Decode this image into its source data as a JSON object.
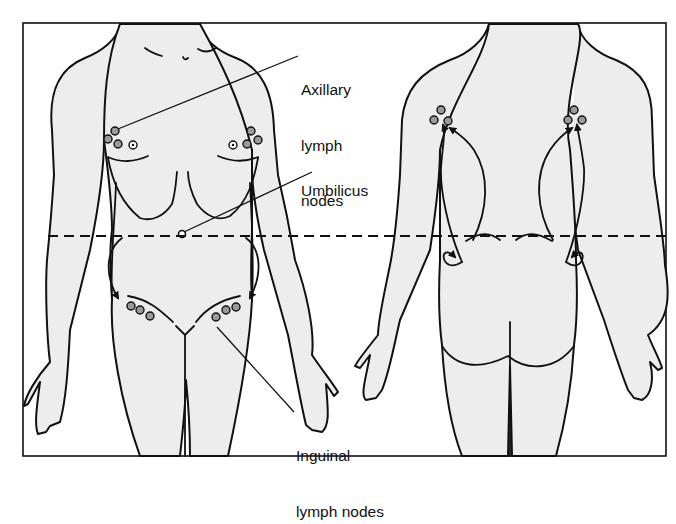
{
  "figure": {
    "type": "anatomical-diagram",
    "views": [
      {
        "id": "anterior",
        "description": "front view of torso and thighs"
      },
      {
        "id": "posterior",
        "description": "back view of torso and thighs"
      }
    ],
    "labels": {
      "axillary": {
        "line1": "Axillary",
        "line2": "lymph",
        "line3": "nodes"
      },
      "umbilicus": {
        "line1": "Umbilicus"
      },
      "inguinal": {
        "line1": "Inguinal",
        "line2": "lymph nodes"
      }
    },
    "divider": {
      "style": "dashed",
      "description": "horizontal line at umbilicus level dividing drainage regions"
    },
    "colors": {
      "stroke": "#111111",
      "body_fill": "#eeeeee",
      "node_fill": "#9a9a9a",
      "background": "#ffffff"
    }
  }
}
